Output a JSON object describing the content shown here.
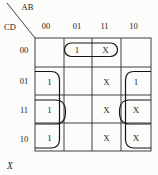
{
  "colors": {
    "ink": "#1c1c1c",
    "paper": "#fcfcfb"
  },
  "kmap": {
    "corner": {
      "column_var": "AB",
      "row_var": "CD"
    },
    "column_headers": [
      "00",
      "01",
      "11",
      "10"
    ],
    "row_headers": [
      "00",
      "01",
      "11",
      "10"
    ],
    "cells": [
      [
        "",
        "1",
        "X",
        ""
      ],
      [
        "1",
        "",
        "X",
        "1"
      ],
      [
        "1",
        "",
        "X",
        "X"
      ],
      [
        "1",
        "",
        "X",
        "X"
      ]
    ],
    "groups": [
      {
        "name": "top-oval",
        "covers": "row 00, columns 01 and 11"
      },
      {
        "name": "left-tall-loop",
        "covers": "column 00, rows 01-10, open at left edge"
      },
      {
        "name": "left-small-loop",
        "covers": "column 00, row 11, open at left edge"
      },
      {
        "name": "right-tall-loop",
        "covers": "column 10, rows 01-10, open at right edge"
      },
      {
        "name": "right-small-loop",
        "covers": "column 10, row 11, open at right edge"
      }
    ],
    "footer_label": "X"
  }
}
